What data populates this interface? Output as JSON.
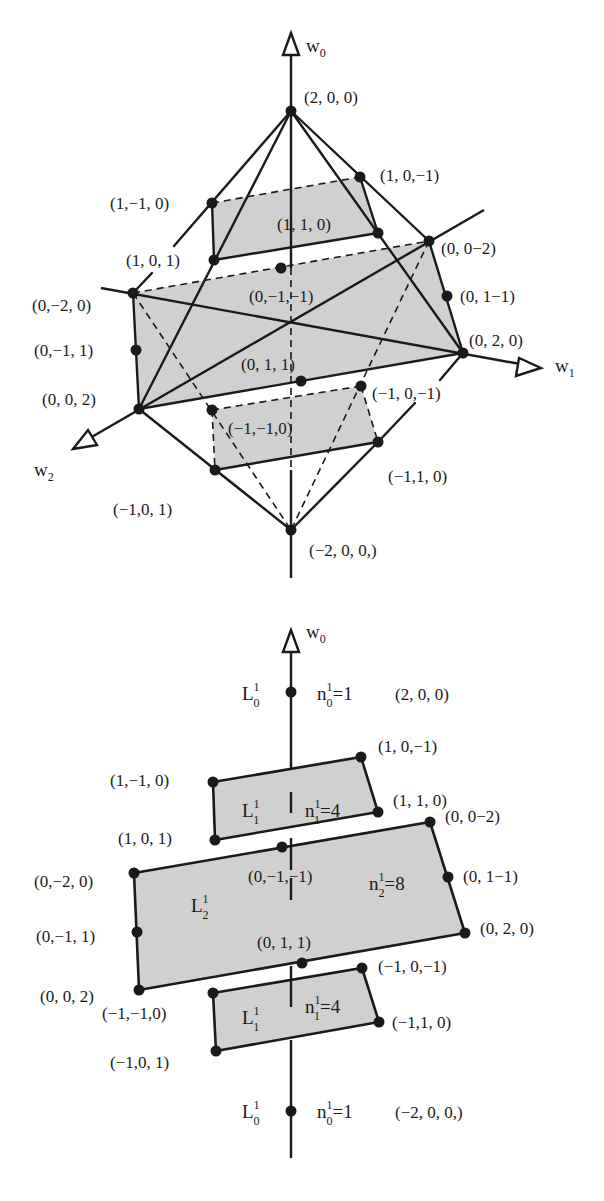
{
  "top_diagram": {
    "axes": {
      "w0": {
        "label": "w",
        "sub": "0"
      },
      "w1": {
        "label": "w",
        "sub": "1"
      },
      "w2": {
        "label": "w",
        "sub": "2"
      }
    },
    "points": [
      {
        "id": "p200",
        "label": "(2, 0, 0)"
      },
      {
        "id": "p1m10",
        "label": "(1,−1, 0)"
      },
      {
        "id": "p10m1",
        "label": "(1, 0,−1)"
      },
      {
        "id": "p110",
        "label": "(1, 1, 0)"
      },
      {
        "id": "p101",
        "label": "(1, 0, 1)"
      },
      {
        "id": "p00m2",
        "label": "(0, 0−2)"
      },
      {
        "id": "p0m1m1",
        "label": "(0,−1,−1)"
      },
      {
        "id": "p0m20",
        "label": "(0,−2, 0)"
      },
      {
        "id": "p01m1",
        "label": "(0, 1−1)"
      },
      {
        "id": "p0m11",
        "label": "(0,−1, 1)"
      },
      {
        "id": "p020",
        "label": "(0, 2, 0)"
      },
      {
        "id": "p011",
        "label": "(0, 1, 1)"
      },
      {
        "id": "p002",
        "label": "(0, 0, 2)"
      },
      {
        "id": "pm10m1",
        "label": "(−1, 0,−1)"
      },
      {
        "id": "pm1m10",
        "label": "(−1,−1,0)"
      },
      {
        "id": "pm110",
        "label": "(−1,1, 0)"
      },
      {
        "id": "pm101",
        "label": "(−1,0, 1)"
      },
      {
        "id": "pm200",
        "label": "(−2, 0, 0,)"
      }
    ]
  },
  "bottom_diagram": {
    "axes": {
      "w0": {
        "label": "w",
        "sub": "0"
      }
    },
    "layers": [
      {
        "name": "L",
        "sup": "1",
        "sub": "0",
        "count_label": "n",
        "count_sup": "1",
        "count_sub": "0",
        "count_value": "=1",
        "position": "top"
      },
      {
        "name": "L",
        "sup": "1",
        "sub": "1",
        "count_label": "n",
        "count_sup": "1",
        "count_sub": "1",
        "count_value": "=4",
        "position": "upper"
      },
      {
        "name": "L",
        "sup": "1",
        "sub": "2",
        "count_label": "n",
        "count_sup": "1",
        "count_sub": "2",
        "count_value": "=8",
        "position": "middle"
      },
      {
        "name": "L",
        "sup": "1",
        "sub": "1",
        "count_label": "n",
        "count_sup": "1",
        "count_sub": "1",
        "count_value": "=4",
        "position": "lower"
      },
      {
        "name": "L",
        "sup": "1",
        "sub": "0",
        "count_label": "n",
        "count_sup": "1",
        "count_sub": "0",
        "count_value": "=1",
        "position": "bottom"
      }
    ],
    "points": [
      {
        "id": "p200",
        "label": "(2, 0, 0)"
      },
      {
        "id": "p10m1",
        "label": "(1, 0,−1)"
      },
      {
        "id": "p1m10",
        "label": "(1,−1, 0)"
      },
      {
        "id": "p110",
        "label": "(1, 1, 0)"
      },
      {
        "id": "p101",
        "label": "(1, 0, 1)"
      },
      {
        "id": "p00m2",
        "label": "(0, 0−2)"
      },
      {
        "id": "p0m1m1",
        "label": "(0,−1,−1)"
      },
      {
        "id": "p0m20",
        "label": "(0,−2, 0)"
      },
      {
        "id": "p01m1",
        "label": "(0, 1−1)"
      },
      {
        "id": "p0m11",
        "label": "(0,−1, 1)"
      },
      {
        "id": "p020",
        "label": "(0, 2, 0)"
      },
      {
        "id": "p011",
        "label": "(0, 1, 1)"
      },
      {
        "id": "p002",
        "label": "(0, 0, 2)"
      },
      {
        "id": "pm10m1",
        "label": "(−1, 0,−1)"
      },
      {
        "id": "pm1m10",
        "label": "(−1,−1,0)"
      },
      {
        "id": "pm110",
        "label": "(−1,1, 0)"
      },
      {
        "id": "pm101",
        "label": "(−1,0, 1)"
      },
      {
        "id": "pm200",
        "label": "(−2, 0, 0,)"
      }
    ]
  },
  "colors": {
    "ink": "#1a1a1a",
    "shade": "#d0d0d0",
    "background": "#ffffff"
  }
}
